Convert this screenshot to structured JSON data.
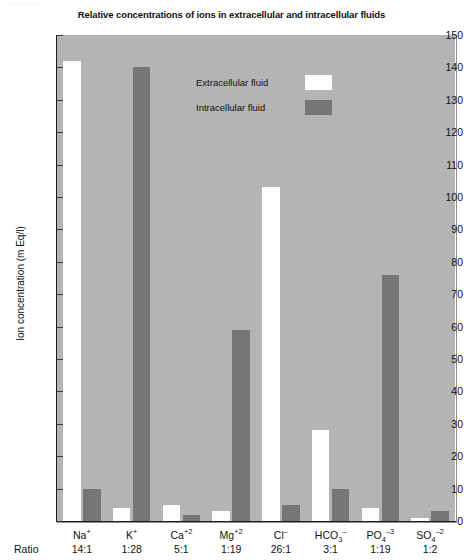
{
  "scan_residue_text": "......................",
  "chart_data": {
    "type": "bar",
    "title": "Relative concentrations of ions in extracellular and intracellular fluids",
    "xlabel": "",
    "ylabel": "Ion concentration (m Eq/l)",
    "ylim": [
      0,
      150
    ],
    "ytick_step": 10,
    "yticks": [
      0,
      10,
      20,
      30,
      40,
      50,
      60,
      70,
      80,
      90,
      100,
      110,
      120,
      130,
      140,
      150
    ],
    "ytick_labels": [
      "0",
      "10",
      "20",
      "30",
      "40",
      "50",
      "60",
      "70",
      "80",
      "90",
      "100",
      "110",
      "120",
      "130",
      "140",
      "150"
    ],
    "grid": false,
    "legend_position": "upper center inside",
    "categories": [
      "Na +",
      "K +",
      "Ca +2",
      "Mg +2",
      "Cl -",
      "HCO3 -",
      "PO4 -3",
      "SO4 -2"
    ],
    "series": [
      {
        "name": "Extracellular fluid",
        "color": "#fdfdfd",
        "values": [
          142,
          4,
          5,
          3,
          103,
          28,
          4,
          1
        ]
      },
      {
        "name": "Intracellular fluid",
        "color": "#767676",
        "values": [
          10,
          140,
          2,
          59,
          5,
          10,
          76,
          3
        ]
      }
    ],
    "ratio_row_label": "Ratio",
    "ratios": [
      "14:1",
      "1:28",
      "5:1",
      "1:19",
      "26:1",
      "3:1",
      "1:19",
      "1:2"
    ],
    "ion_labels": [
      {
        "base": "Na",
        "sup": "+",
        "sub": ""
      },
      {
        "base": "K",
        "sup": "+",
        "sub": ""
      },
      {
        "base": "Ca",
        "sup": "+2",
        "sub": ""
      },
      {
        "base": "Mg",
        "sup": "+2",
        "sub": ""
      },
      {
        "base": "Cl",
        "sup": "–",
        "sub": ""
      },
      {
        "base": "HCO",
        "sup": "–",
        "sub": "3"
      },
      {
        "base": "PO",
        "sup": "–3",
        "sub": "4"
      },
      {
        "base": "SO",
        "sup": "–2",
        "sub": "4"
      }
    ],
    "plot_background": "#b4b4b4"
  }
}
